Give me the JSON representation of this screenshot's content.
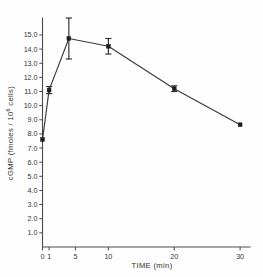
{
  "chart_data": {
    "type": "line",
    "title": "",
    "xlabel": "TIME  (min)",
    "ylabel": "cGMP  (fmoles / 10",
    "ylabel_superscript": "6",
    "ylabel_tail": " cells)",
    "xlim": [
      0,
      31.5
    ],
    "ylim": [
      0,
      16.2
    ],
    "grid": false,
    "legend": "none",
    "xticks": [
      0,
      1,
      5,
      10,
      20,
      30
    ],
    "xticklabels": [
      "0",
      "1",
      "5",
      "10",
      "20",
      "30"
    ],
    "yticks": [
      1.0,
      2.0,
      3.0,
      4.0,
      5.0,
      6.0,
      7.0,
      8.0,
      9.0,
      10.0,
      11.0,
      12.0,
      13.0,
      14.0,
      15.0
    ],
    "yticklabels": [
      "1.0",
      "2.0",
      "3.0",
      "4.0",
      "5.0",
      "6.0",
      "7.0",
      "8.0",
      "9.0",
      "10.0",
      "11.0",
      "12.0",
      "13.0",
      "14.0",
      "15.0"
    ],
    "series": [
      {
        "name": "cGMP",
        "marker": "filled-square",
        "x": [
          0,
          1,
          4,
          10,
          20,
          30
        ],
        "y": [
          7.6,
          11.1,
          14.75,
          14.2,
          11.2,
          8.65
        ],
        "yerr": [
          0.0,
          0.25,
          1.45,
          0.55,
          0.2,
          0.0
        ]
      }
    ],
    "colors": {
      "line": "#3a3a3a",
      "marker": "#1d1d1d",
      "axis": "#4a4a4a",
      "error_bar": "#2e2e2e",
      "background": "#fefefe"
    }
  }
}
